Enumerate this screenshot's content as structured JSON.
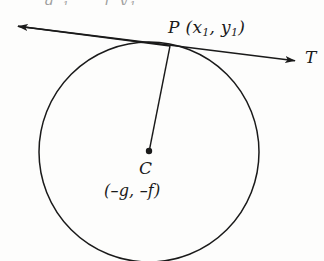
{
  "figure": {
    "type": "geometry-diagram",
    "background_color": "#fdfdfc",
    "ink_color": "#1a1a1a",
    "width": 324,
    "height": 261
  },
  "labels": {
    "tangent_point": {
      "letter": "P",
      "open_paren": " (",
      "x_var": "x",
      "x_sub": "1",
      "comma": ", ",
      "y_var": "y",
      "y_sub": "1",
      "close_paren": ")",
      "full_text": "P (x1, y1)"
    },
    "tangent_line_label": "T",
    "center_letter": "C",
    "center_coords": "(–g, –f)"
  },
  "cut_off_header": {
    "visible_fragment": "x1      y1",
    "x_var": "x",
    "x_sub": "1",
    "y_var": "y",
    "y_sub": "1"
  },
  "geometry": {
    "circle": {
      "center_x": 149,
      "center_y": 152,
      "radius": 110
    },
    "tangent_line": {
      "x1": 8,
      "y1": 25,
      "x2": 305,
      "y2": 62,
      "left_arrow": true,
      "right_arrow": true
    },
    "tangent_point": {
      "x": 170,
      "y": 46
    },
    "radius_segment": {
      "x1": 170,
      "y1": 46,
      "x2": 149,
      "y2": 152
    },
    "center_dot_radius": 3.2
  }
}
